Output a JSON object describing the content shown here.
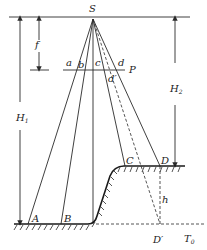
{
  "diagram": {
    "type": "aerial-photo relief displacement geometry",
    "labels": {
      "S": "S",
      "f": "f",
      "P": "P",
      "a": "a",
      "b": "b",
      "c": "c",
      "d": "d",
      "d_prime": "d′",
      "H1": "H",
      "H1_sub": "1",
      "H2": "H",
      "H2_sub": "2",
      "A": "A",
      "B": "B",
      "C": "C",
      "D": "D",
      "D_prime": "D′",
      "h": "h",
      "T0": "T",
      "T0_sub": "0"
    },
    "points": {
      "S": [
        93,
        19
      ],
      "A": [
        28,
        224
      ],
      "B": [
        61,
        224
      ],
      "foot": [
        93,
        224
      ],
      "C": [
        125,
        166
      ],
      "D": [
        160,
        166
      ],
      "D_prime": [
        160,
        224
      ]
    }
  }
}
